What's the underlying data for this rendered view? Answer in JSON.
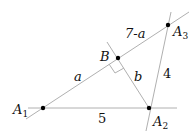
{
  "diagram": {
    "points": [
      {
        "id": "A1",
        "name": "A",
        "sub": "1",
        "x": 43,
        "y": 108
      },
      {
        "id": "A2",
        "name": "A",
        "sub": "2",
        "x": 149,
        "y": 108
      },
      {
        "id": "A3",
        "name": "A",
        "sub": "3",
        "x": 168,
        "y": 25
      },
      {
        "id": "B",
        "name": "B",
        "sub": "",
        "x": 118,
        "y": 58
      }
    ],
    "segment_labels": {
      "a": "a",
      "seven_minus_a": "7-a",
      "b": "b",
      "five": "5",
      "four": "4"
    },
    "colors": {
      "line": "#b0b0b0",
      "point": "#000000",
      "text": "#111111"
    }
  }
}
